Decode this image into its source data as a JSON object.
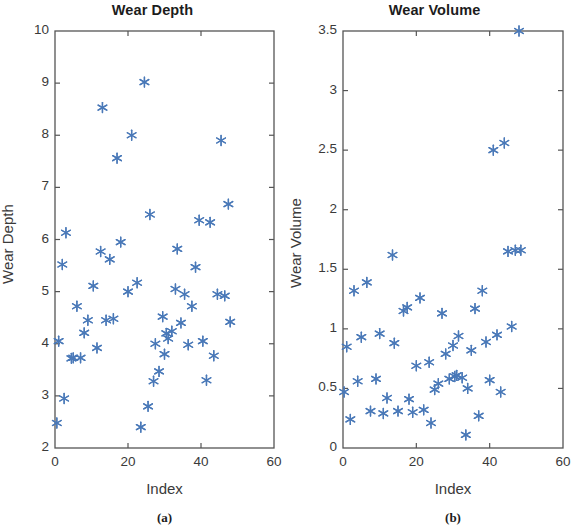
{
  "figure": {
    "background": "#ffffff",
    "marker_color": "#4a79b8",
    "axis_color": "#555555",
    "text_color": "#3a3a3a"
  },
  "panels": [
    {
      "id": "a",
      "caption": "(a)",
      "chart_key": 0
    },
    {
      "id": "b",
      "caption": "(b)",
      "chart_key": 1
    }
  ],
  "chart_data": [
    {
      "type": "scatter",
      "title": "Wear Depth",
      "xlabel": "Index",
      "ylabel": "Wear Depth",
      "xlim": [
        0,
        60
      ],
      "ylim": [
        2,
        10
      ],
      "xticks": [
        0,
        20,
        40,
        60
      ],
      "xtick_labels": [
        "0",
        "20",
        "40",
        "60"
      ],
      "yticks": [
        2,
        3,
        4,
        5,
        6,
        7,
        8,
        9,
        10
      ],
      "ytick_labels": [
        "2",
        "3",
        "4",
        "5",
        "6",
        "7",
        "8",
        "9",
        "10"
      ],
      "grid": false,
      "legend": null,
      "marker": "asterisk",
      "marker_color": "#4a79b8",
      "x": [
        0.5,
        1.0,
        2.0,
        2.5,
        3.0,
        4.5,
        5.0,
        6.0,
        7.0,
        8.0,
        9.0,
        10.5,
        11.5,
        12.5,
        13.0,
        14.0,
        15.0,
        16.0,
        17.0,
        18.0,
        20.0,
        21.0,
        22.5,
        23.5,
        24.5,
        25.5,
        26.0,
        27.0,
        27.5,
        28.5,
        29.5,
        30.0,
        30.5,
        31.0,
        32.0,
        33.0,
        33.5,
        34.5,
        35.5,
        36.5,
        37.5,
        38.5,
        39.5,
        40.5,
        41.5,
        42.5,
        43.5,
        44.5,
        45.5,
        46.5,
        47.5,
        48.0
      ],
      "y": [
        2.48,
        4.05,
        5.52,
        2.95,
        6.13,
        3.72,
        3.73,
        4.72,
        3.73,
        4.21,
        4.45,
        5.11,
        3.92,
        5.77,
        8.53,
        4.45,
        5.62,
        4.48,
        7.56,
        5.95,
        5.0,
        8.0,
        5.17,
        2.4,
        9.02,
        2.8,
        6.48,
        3.28,
        4.0,
        3.47,
        4.52,
        3.8,
        4.2,
        4.1,
        4.24,
        5.05,
        5.82,
        4.4,
        4.95,
        3.98,
        4.72,
        5.47,
        6.37,
        4.05,
        3.3,
        6.33,
        3.77,
        4.95,
        7.9,
        4.92,
        6.68,
        4.42
      ]
    },
    {
      "type": "scatter",
      "title": "Wear Volume",
      "xlabel": "Index",
      "ylabel": "Wear Volume",
      "xlim": [
        0,
        60
      ],
      "ylim": [
        0,
        3.5
      ],
      "xticks": [
        0,
        20,
        40,
        60
      ],
      "xtick_labels": [
        "0",
        "20",
        "40",
        "60"
      ],
      "yticks": [
        0,
        0.5,
        1,
        1.5,
        2,
        2.5,
        3,
        3.5
      ],
      "ytick_labels": [
        "0",
        "0.5",
        "1",
        "1.5",
        "2",
        "2.5",
        "3",
        "3.5"
      ],
      "grid": false,
      "legend": null,
      "marker": "asterisk",
      "marker_color": "#4a79b8",
      "x": [
        0.3,
        1.0,
        2.0,
        3.0,
        4.0,
        5.0,
        6.5,
        7.5,
        9.0,
        10.0,
        11.0,
        12.0,
        13.5,
        14.0,
        15.0,
        16.5,
        17.5,
        18.0,
        19.0,
        20.0,
        21.0,
        22.0,
        23.5,
        24.0,
        25.0,
        26.0,
        27.0,
        28.0,
        29.0,
        30.0,
        30.5,
        31.0,
        31.5,
        32.5,
        33.5,
        34.0,
        35.0,
        36.0,
        37.0,
        38.0,
        39.0,
        40.0,
        41.0,
        42.0,
        43.0,
        44.0,
        45.0,
        46.0,
        47.0,
        48.0,
        48.5
      ],
      "y": [
        0.47,
        0.85,
        0.24,
        1.32,
        0.56,
        0.93,
        1.39,
        0.31,
        0.58,
        0.96,
        0.29,
        0.42,
        1.62,
        0.88,
        0.31,
        1.15,
        1.18,
        0.41,
        0.3,
        0.69,
        1.26,
        0.32,
        0.72,
        0.21,
        0.49,
        0.54,
        1.13,
        0.79,
        0.58,
        0.86,
        0.6,
        0.61,
        0.94,
        0.59,
        0.11,
        0.5,
        0.82,
        1.17,
        0.27,
        1.32,
        0.89,
        0.57,
        2.5,
        0.95,
        0.47,
        2.56,
        1.65,
        1.02,
        1.66,
        3.5,
        1.66
      ]
    }
  ]
}
